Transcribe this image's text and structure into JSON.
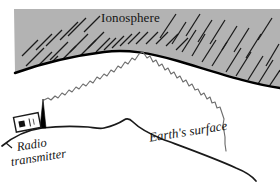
{
  "figure": {
    "kind": "physics-diagram",
    "title_visible": false,
    "background_color": "#ffffff"
  },
  "labels": {
    "ionosphere": "Ionosphere",
    "earth_surface": "Earth's surface",
    "radio_transmitter_line1": "Radio",
    "radio_transmitter_line2": "transmitter"
  },
  "colors": {
    "ionosphere_fill": "#b3b3b3",
    "ionosphere_hatch": "#1a1a1a",
    "ionosphere_boundary": "#000000",
    "ground_line": "#1a1a1a",
    "ray": "#6e6e6e",
    "antenna": "#000000",
    "transmitter_box_fill": "#ffffff",
    "transmitter_box_stroke": "#1a1a1a",
    "label_text": "#141414"
  },
  "elements": {
    "ionosphere_band": "gray hatched arc band across top of figure",
    "ionosphere_lower_boundary": "thick black curved arc",
    "radio_wave_ray": "zigzag wave from antenna up to ionosphere and back down to ground",
    "antenna_mast": "thin black triangular spire",
    "transmitter_box": "small tilted rectangle with dark square dial",
    "earth_surface_curve": "curved ground line with hill"
  },
  "geometry": {
    "width": 280,
    "height": 183,
    "ionosphere_top_y": 9,
    "ionosphere_boundary_apex": [
      145,
      50
    ],
    "ray_origin": [
      44,
      100
    ],
    "ray_reflection_point": [
      143,
      52
    ],
    "ray_end": [
      226,
      151
    ],
    "antenna_base": [
      46,
      128
    ],
    "antenna_tip": [
      43,
      99
    ],
    "hill_peak": [
      128,
      120
    ]
  }
}
